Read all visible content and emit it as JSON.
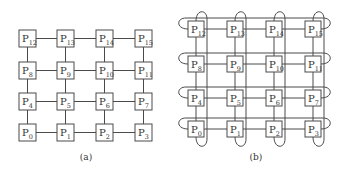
{
  "figure": {
    "panels": [
      {
        "id": "a",
        "caption": "(a)",
        "topology": "2D mesh",
        "rows_top_to_bottom": [
          [
            "P12",
            "P13",
            "P14",
            "P15"
          ],
          [
            "P8",
            "P9",
            "P10",
            "P11"
          ],
          [
            "P4",
            "P5",
            "P6",
            "P7"
          ],
          [
            "P0",
            "P1",
            "P2",
            "P3"
          ]
        ],
        "node_prefix": "P",
        "subscripts_top_to_bottom": [
          [
            "12",
            "13",
            "14",
            "15"
          ],
          [
            "8",
            "9",
            "10",
            "11"
          ],
          [
            "4",
            "5",
            "6",
            "7"
          ],
          [
            "0",
            "1",
            "2",
            "3"
          ]
        ],
        "wraparound": false
      },
      {
        "id": "b",
        "caption": "(b)",
        "topology": "2D torus",
        "node_prefix": "P",
        "subscripts_top_to_bottom": [
          [
            "12",
            "13",
            "14",
            "15"
          ],
          [
            "8",
            "9",
            "10",
            "11"
          ],
          [
            "4",
            "5",
            "6",
            "7"
          ],
          [
            "0",
            "1",
            "2",
            "3"
          ]
        ],
        "wraparound": true
      }
    ],
    "colors": {
      "stroke": "#4a4a4a",
      "text": "#333333",
      "background": "#ffffff"
    }
  }
}
